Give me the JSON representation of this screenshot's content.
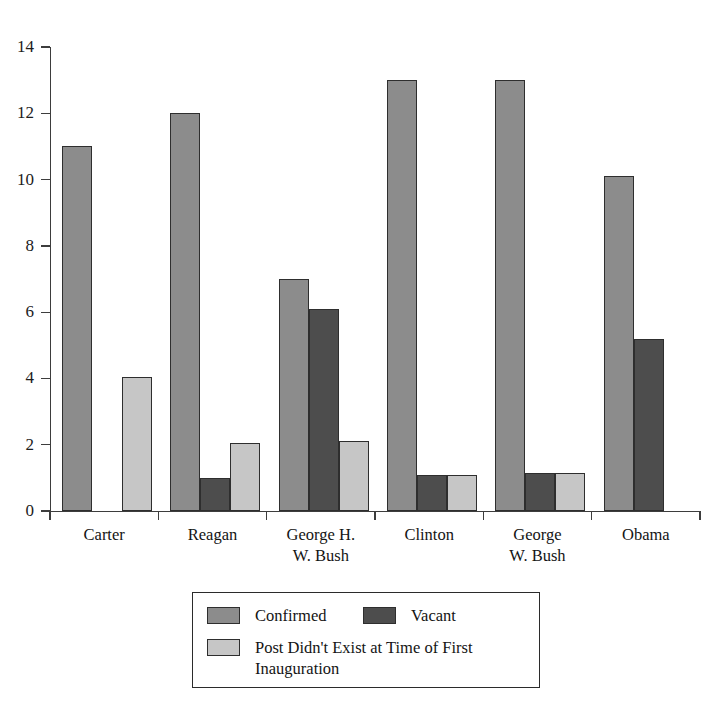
{
  "chart_data": {
    "type": "bar",
    "title": "",
    "subtitle": "",
    "xlabel": "",
    "ylabel": "",
    "ylim": [
      0,
      14
    ],
    "yticks": [
      0,
      2,
      4,
      6,
      8,
      10,
      12,
      14
    ],
    "ytick_labels": [
      "0",
      "2",
      "4",
      "6",
      "8",
      "10",
      "12",
      "14"
    ],
    "grid": false,
    "legend_position": "bottom-center",
    "categories": [
      "Carter",
      "Reagan",
      "George H.\nW. Bush",
      "Clinton",
      "George\nW. Bush",
      "Obama"
    ],
    "series": [
      {
        "name": "Confirmed",
        "color": "#8c8c8c",
        "values": [
          11,
          12,
          7,
          13,
          13,
          10.1
        ]
      },
      {
        "name": "Vacant",
        "color": "#4d4d4d",
        "values": [
          0,
          1,
          6.1,
          1.1,
          1.15,
          5.2
        ]
      },
      {
        "name": "Post Didn't Exist at Time of First\nInauguration",
        "color": "#c6c6c6",
        "values": [
          4.05,
          2.05,
          2.1,
          1.1,
          1.15,
          0
        ]
      }
    ]
  },
  "axis": {
    "y_tick_labels": [
      "14",
      "12",
      "10",
      "8",
      "6",
      "4",
      "2",
      "0"
    ]
  },
  "legend": {
    "entries": [
      {
        "label": "Confirmed",
        "color": "#8c8c8c"
      },
      {
        "label": "Vacant",
        "color": "#4d4d4d"
      },
      {
        "label": "Post Didn't Exist at Time of First\nInauguration",
        "color": "#c6c6c6"
      }
    ]
  },
  "group_labels": [
    "Carter",
    "Reagan",
    "George H.\nW. Bush",
    "Clinton",
    "George\nW. Bush",
    "Obama"
  ]
}
